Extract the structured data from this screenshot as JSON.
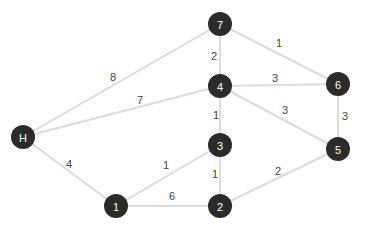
{
  "graph": {
    "colors": {
      "node_fill": "#2b2b2b",
      "node_text": "#ffffff",
      "edge": "#dcdcdc",
      "weight_text": "#444444"
    },
    "nodes": [
      {
        "id": "H",
        "label": "H",
        "x": 23,
        "y": 137
      },
      {
        "id": "1",
        "label": "1",
        "x": 116,
        "y": 206
      },
      {
        "id": "2",
        "label": "2",
        "x": 220,
        "y": 206
      },
      {
        "id": "3",
        "label": "3",
        "x": 220,
        "y": 145
      },
      {
        "id": "4",
        "label": "4",
        "x": 220,
        "y": 86
      },
      {
        "id": "5",
        "label": "5",
        "x": 338,
        "y": 149
      },
      {
        "id": "6",
        "label": "6",
        "x": 338,
        "y": 84
      },
      {
        "id": "7",
        "label": "7",
        "x": 220,
        "y": 24
      }
    ],
    "edges": [
      {
        "from": "H",
        "to": "7",
        "weight": "8",
        "lx": 113,
        "ly": 77
      },
      {
        "from": "H",
        "to": "4",
        "weight": "7",
        "lx": 140,
        "ly": 100
      },
      {
        "from": "H",
        "to": "1",
        "weight": "4",
        "lx": 69,
        "ly": 164
      },
      {
        "from": "7",
        "to": "4",
        "weight": "2",
        "lx": 214,
        "ly": 56
      },
      {
        "from": "7",
        "to": "6",
        "weight": "1",
        "lx": 279,
        "ly": 43
      },
      {
        "from": "4",
        "to": "6",
        "weight": "3",
        "lx": 275,
        "ly": 78
      },
      {
        "from": "4",
        "to": "5",
        "weight": "3",
        "lx": 285,
        "ly": 110
      },
      {
        "from": "4",
        "to": "3",
        "weight": "1",
        "lx": 216,
        "ly": 115
      },
      {
        "from": "6",
        "to": "5",
        "weight": "3",
        "lx": 345,
        "ly": 116
      },
      {
        "from": "3",
        "to": "1",
        "weight": "1",
        "lx": 166,
        "ly": 165
      },
      {
        "from": "3",
        "to": "2",
        "weight": "1",
        "lx": 215,
        "ly": 174
      },
      {
        "from": "1",
        "to": "2",
        "weight": "6",
        "lx": 172,
        "ly": 196
      },
      {
        "from": "2",
        "to": "5",
        "weight": "2",
        "lx": 278,
        "ly": 171
      }
    ]
  }
}
